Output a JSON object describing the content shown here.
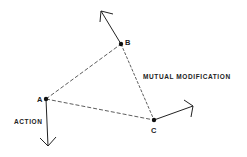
{
  "diagram": {
    "points": [
      {
        "id": "A",
        "label": "A"
      },
      {
        "id": "B",
        "label": "B"
      },
      {
        "id": "C",
        "label": "C"
      }
    ],
    "edges": [
      {
        "from": "A",
        "to": "B",
        "style": "dashed"
      },
      {
        "from": "A",
        "to": "C",
        "style": "dashed"
      },
      {
        "from": "B",
        "to": "C",
        "style": "dashed"
      }
    ],
    "arrows": [
      {
        "from": "A",
        "direction": "down"
      },
      {
        "from": "B",
        "direction": "up-left"
      },
      {
        "from": "C",
        "direction": "right"
      }
    ],
    "captions": {
      "mutual": "MUTUAL MODIFICATION",
      "action": "ACTION"
    },
    "colors": {
      "ink": "#222222",
      "background": "#ffffff"
    }
  }
}
